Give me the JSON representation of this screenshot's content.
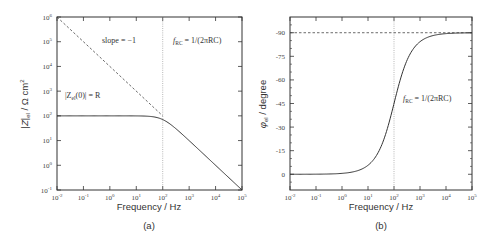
{
  "chart_data": [
    {
      "panel": "(a)",
      "type": "line",
      "xlabel": "Frequency / Hz",
      "ylabel": "|Z|_el / Ω cm²",
      "xscale": "log",
      "yscale": "log",
      "xlim": [
        0.01,
        100000
      ],
      "ylim": [
        0.1,
        1000000
      ],
      "x_ticks": [
        "10^-2",
        "10^-1",
        "10^0",
        "10^1",
        "10^2",
        "10^3",
        "10^4",
        "10^5"
      ],
      "y_ticks": [
        "10^-1",
        "10^0",
        "10^1",
        "10^2",
        "10^3",
        "10^4",
        "10^5",
        "10^6"
      ],
      "series": [
        {
          "name": "|Z_el|",
          "style": "solid",
          "x": [
            0.01,
            0.1,
            1,
            10,
            50,
            100,
            200,
            1000,
            10000,
            100000
          ],
          "y": [
            100,
            100,
            100,
            99.9,
            97,
            70.7,
            44.7,
            10,
            1,
            0.1
          ]
        },
        {
          "name": "slope = -1 asymptote",
          "style": "dashed",
          "x": [
            0.01,
            100
          ],
          "y": [
            1000000,
            100
          ]
        },
        {
          "name": "f_RC",
          "style": "dotted-vertical",
          "x": [
            100,
            100
          ],
          "y": [
            0.1,
            1000000
          ]
        }
      ],
      "annotations": [
        "slope = −1",
        "f_RC = 1/(2πRC)",
        "|Z_el(0)| = R"
      ],
      "grid": false
    },
    {
      "panel": "(b)",
      "type": "line",
      "xlabel": "Frequency / Hz",
      "ylabel": "φ_el / degree",
      "xscale": "log",
      "yscale": "linear",
      "xlim": [
        0.01,
        100000
      ],
      "ylim": [
        -10,
        100
      ],
      "x_ticks": [
        "10^-2",
        "10^-1",
        "10^0",
        "10^1",
        "10^2",
        "10^3",
        "10^4",
        "10^5"
      ],
      "y_ticks": [
        "0",
        "-15",
        "-30",
        "-45",
        "-60",
        "-75",
        "-90"
      ],
      "series": [
        {
          "name": "φ_el",
          "style": "solid",
          "x": [
            0.01,
            0.1,
            1,
            3,
            10,
            30,
            100,
            300,
            1000,
            10000,
            100000
          ],
          "y": [
            0.006,
            0.06,
            0.57,
            1.7,
            5.7,
            16.7,
            45,
            71.6,
            84.3,
            89.4,
            89.9
          ]
        },
        {
          "name": "-90 asymptote",
          "style": "dashed",
          "x": [
            0.01,
            100000
          ],
          "y": [
            90,
            90
          ]
        },
        {
          "name": "f_RC",
          "style": "dotted-vertical",
          "x": [
            100,
            100
          ],
          "y": [
            -10,
            100
          ]
        }
      ],
      "annotations": [
        "f_RC = 1/(2πRC)"
      ],
      "grid": false
    }
  ],
  "panels": {
    "a": {
      "caption": "(a)",
      "xlabel": "Frequency / Hz",
      "ylabel": "|Z|el / Ω cm2",
      "slope_label": "slope = −1",
      "frc_label": "f",
      "frc_sub": "RC",
      "frc_eq": " = 1/(2πRC)",
      "z0_label_a": "|Z",
      "z0_sub": "el",
      "z0_label_b": "(0)| = R",
      "x_ticks": [
        {
          "base": "10",
          "exp": "-2"
        },
        {
          "base": "10",
          "exp": "-1"
        },
        {
          "base": "10",
          "exp": "0"
        },
        {
          "base": "10",
          "exp": "1"
        },
        {
          "base": "10",
          "exp": "2"
        },
        {
          "base": "10",
          "exp": "3"
        },
        {
          "base": "10",
          "exp": "4"
        },
        {
          "base": "10",
          "exp": "5"
        }
      ],
      "y_ticks": [
        {
          "base": "10",
          "exp": "-1"
        },
        {
          "base": "10",
          "exp": "0"
        },
        {
          "base": "10",
          "exp": "1"
        },
        {
          "base": "10",
          "exp": "2"
        },
        {
          "base": "10",
          "exp": "3"
        },
        {
          "base": "10",
          "exp": "4"
        },
        {
          "base": "10",
          "exp": "5"
        },
        {
          "base": "10",
          "exp": "6"
        }
      ]
    },
    "b": {
      "caption": "(b)",
      "xlabel": "Frequency / Hz",
      "ylabel": "φel / degree",
      "frc_label": "f",
      "frc_sub": "RC",
      "frc_eq": " = 1/(2πRC)",
      "x_ticks": [
        {
          "base": "10",
          "exp": "-2"
        },
        {
          "base": "10",
          "exp": "-1"
        },
        {
          "base": "10",
          "exp": "0"
        },
        {
          "base": "10",
          "exp": "1"
        },
        {
          "base": "10",
          "exp": "2"
        },
        {
          "base": "10",
          "exp": "3"
        },
        {
          "base": "10",
          "exp": "4"
        },
        {
          "base": "10",
          "exp": "5"
        }
      ],
      "y_ticks": [
        "0",
        "-15",
        "-30",
        "-45",
        "-60",
        "-75",
        "-90"
      ]
    }
  }
}
